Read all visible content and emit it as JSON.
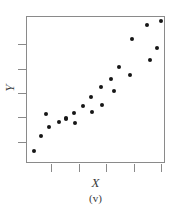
{
  "figure": {
    "caption": "(v)",
    "axis_color": "#8a8a8a",
    "point_color": "#161616",
    "text_color": "#3a3a3a"
  },
  "chart_data": {
    "type": "scatter",
    "title": "",
    "xlabel": "X",
    "ylabel": "Y",
    "caption": "(v)",
    "grid": false,
    "legend": null,
    "xlim": [
      0,
      100
    ],
    "ylim": [
      0,
      100
    ],
    "xticks": [
      11,
      31,
      51,
      71,
      91
    ],
    "yticks": [
      19,
      36,
      53,
      70,
      87
    ],
    "xtick_labels": [
      "",
      "",
      "",
      "",
      ""
    ],
    "ytick_labels": [
      "",
      "",
      "",
      "",
      ""
    ],
    "n_points": 21,
    "points": [
      {
        "x": 6,
        "y": 9
      },
      {
        "x": 10,
        "y": 26
      },
      {
        "x": 16,
        "y": 40
      },
      {
        "x": 20,
        "y": 32
      },
      {
        "x": 31,
        "y": 31
      },
      {
        "x": 34,
        "y": 38
      },
      {
        "x": 34,
        "y": 37
      },
      {
        "x": 43,
        "y": 47
      },
      {
        "x": 48,
        "y": 43
      },
      {
        "x": 54,
        "y": 55
      },
      {
        "x": 57,
        "y": 51
      },
      {
        "x": 61,
        "y": 60
      },
      {
        "x": 63,
        "y": 66
      },
      {
        "x": 66,
        "y": 50
      },
      {
        "x": 71,
        "y": 51
      },
      {
        "x": 75,
        "y": 61
      },
      {
        "x": 78,
        "y": 76
      },
      {
        "x": 87,
        "y": 69
      },
      {
        "x": 90,
        "y": 80
      },
      {
        "x": 88,
        "y": 93
      },
      {
        "x": 98,
        "y": 96
      }
    ],
    "pixel_points": [
      {
        "px": 34,
        "py": 151
      },
      {
        "px": 41,
        "py": 136
      },
      {
        "px": 46,
        "py": 114
      },
      {
        "px": 49,
        "py": 127
      },
      {
        "px": 59,
        "py": 122
      },
      {
        "px": 66,
        "py": 119
      },
      {
        "px": 66,
        "py": 118
      },
      {
        "px": 74,
        "py": 113
      },
      {
        "px": 75,
        "py": 123
      },
      {
        "px": 83,
        "py": 106
      },
      {
        "px": 91,
        "py": 97
      },
      {
        "px": 92,
        "py": 112
      },
      {
        "px": 101,
        "py": 87
      },
      {
        "px": 102,
        "py": 105
      },
      {
        "px": 111,
        "py": 79
      },
      {
        "px": 114,
        "py": 91
      },
      {
        "px": 119,
        "py": 67
      },
      {
        "px": 130,
        "py": 75
      },
      {
        "px": 132,
        "py": 39
      },
      {
        "px": 147,
        "py": 25
      },
      {
        "px": 157,
        "py": 48
      },
      {
        "px": 150,
        "py": 60
      },
      {
        "px": 161,
        "py": 21
      }
    ]
  },
  "y_ticks_px": [
    44,
    69,
    93,
    117,
    142
  ],
  "x_ticks_px": [
    51,
    79,
    106,
    134,
    161
  ]
}
